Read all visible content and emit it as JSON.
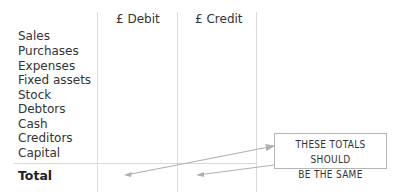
{
  "columns": {
    "debit": "£ Debit",
    "credit": "£ Credit"
  },
  "rows": [
    "Sales",
    "Purchases",
    "Expenses",
    "Fixed assets",
    "Stock",
    "Debtors",
    "Cash",
    "Creditors",
    "Capital"
  ],
  "total_label": "Total",
  "callout": {
    "line1": "THESE TOTALS SHOULD",
    "line2": "BE THE SAME"
  }
}
